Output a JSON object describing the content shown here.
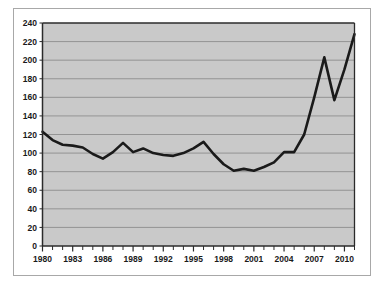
{
  "figure": {
    "background_color": "#ffffff",
    "frame_color": "#a8a8a8"
  },
  "chart_data": {
    "type": "line",
    "title": "",
    "subtitle": "",
    "xlabel": "",
    "ylabel": "",
    "xlim": [
      1980,
      2011
    ],
    "ylim": [
      0,
      240
    ],
    "grid": "horizontal",
    "legend": "none",
    "plot_background_color": "#c9c9c9",
    "gridline_color": "#8d8d8d",
    "axis_color": "#2b2b2b",
    "line_color": "#1a1a1a",
    "line_width": 2.6,
    "y_ticks": [
      0,
      20,
      40,
      60,
      80,
      100,
      120,
      140,
      160,
      180,
      200,
      220,
      240
    ],
    "y_tick_labels": [
      "0",
      "20",
      "40",
      "60",
      "80",
      "100",
      "120",
      "140",
      "160",
      "180",
      "200",
      "220",
      "240"
    ],
    "x_ticks": [
      1980,
      1981,
      1982,
      1983,
      1984,
      1985,
      1986,
      1987,
      1988,
      1989,
      1990,
      1991,
      1992,
      1993,
      1994,
      1995,
      1996,
      1997,
      1998,
      1999,
      2000,
      2001,
      2002,
      2003,
      2004,
      2005,
      2006,
      2007,
      2008,
      2009,
      2010,
      2011
    ],
    "x_tick_labels_major": [
      "1980",
      "1983",
      "1986",
      "1989",
      "1992",
      "1995",
      "1998",
      "2001",
      "2004",
      "2007",
      "2010"
    ],
    "x_major_step": 3,
    "x": [
      1980,
      1981,
      1982,
      1983,
      1984,
      1985,
      1986,
      1987,
      1988,
      1989,
      1990,
      1991,
      1992,
      1993,
      1994,
      1995,
      1996,
      1997,
      1998,
      1999,
      2000,
      2001,
      2002,
      2003,
      2004,
      2005,
      2006,
      2007,
      2008,
      2009,
      2010,
      2011
    ],
    "values": [
      123,
      114,
      109,
      108,
      106,
      99,
      94,
      101,
      111,
      101,
      105,
      100,
      98,
      97,
      100,
      105,
      112,
      99,
      88,
      81,
      83,
      81,
      85,
      90,
      101,
      101,
      120,
      160,
      203,
      157,
      190,
      228
    ],
    "series": [
      {
        "name": "series-1",
        "values": [
          123,
          114,
          109,
          108,
          106,
          99,
          94,
          101,
          111,
          101,
          105,
          100,
          98,
          97,
          100,
          105,
          112,
          99,
          88,
          81,
          83,
          81,
          85,
          90,
          101,
          101,
          120,
          160,
          203,
          157,
          190,
          228
        ]
      }
    ]
  }
}
